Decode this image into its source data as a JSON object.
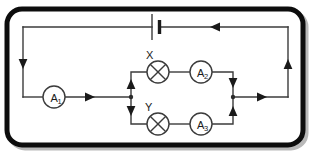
{
  "figure": {
    "width": 310,
    "height": 152,
    "background_color": "#ffffff",
    "frame": {
      "name": "rounded-outer-frame",
      "stroke_color": "#0d0d0d",
      "stroke_width": 5,
      "corner_radius": 14,
      "shadow_color": "#b9b9b9"
    },
    "wire": {
      "stroke_color": "#3b3b3b",
      "stroke_width": 1.4,
      "junction_dot_color": "#2b2b2b",
      "arrow_color": "#1a1a1a"
    }
  },
  "components": {
    "battery": {
      "label": "",
      "symbol_name": "battery-cell",
      "position": "top-middle",
      "long_plate": "negative",
      "short_plate": "positive"
    },
    "ammeter_1": {
      "label": "A",
      "subscript": "1",
      "full_label": "A1",
      "symbol_name": "ammeter",
      "position": "bottom-left-branch"
    },
    "ammeter_2": {
      "label": "A",
      "subscript": "2",
      "full_label": "A2",
      "symbol_name": "ammeter",
      "position": "upper-parallel-branch"
    },
    "ammeter_3": {
      "label": "A",
      "subscript": "3",
      "full_label": "A3",
      "symbol_name": "ammeter",
      "position": "lower-parallel-branch"
    },
    "lamp_x": {
      "label": "X",
      "symbol_name": "lamp",
      "position": "upper-parallel-branch"
    },
    "lamp_y": {
      "label": "Y",
      "symbol_name": "lamp",
      "position": "lower-parallel-branch"
    }
  },
  "current_arrows": [
    {
      "name": "arrow-top-wire",
      "direction": "left"
    },
    {
      "name": "arrow-left-wire",
      "direction": "down"
    },
    {
      "name": "arrow-after-ammeter-1",
      "direction": "right"
    },
    {
      "name": "arrow-left-junction-up",
      "direction": "up"
    },
    {
      "name": "arrow-left-junction-down",
      "direction": "down"
    },
    {
      "name": "arrow-right-junction-down",
      "direction": "down"
    },
    {
      "name": "arrow-right-junction-up",
      "direction": "up"
    },
    {
      "name": "arrow-after-right-junction",
      "direction": "right"
    },
    {
      "name": "arrow-right-wire",
      "direction": "up"
    }
  ],
  "junctions": [
    {
      "name": "junction-left",
      "x": 131,
      "y": 97
    },
    {
      "name": "junction-right",
      "x": 233,
      "y": 97
    }
  ]
}
